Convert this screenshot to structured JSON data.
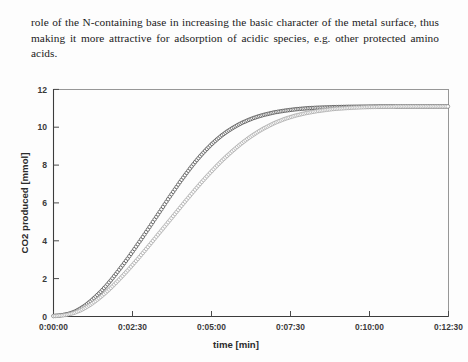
{
  "document": {
    "paragraph": "role of the N-containing base in increasing the basic character of the metal surface, thus making it more attractive for adsorption of acidic species, e.g. other protected amino acids."
  },
  "figure": {
    "name": "co2-production-vs-time-plot"
  },
  "chart_data": {
    "type": "scatter",
    "title": "",
    "xlabel": "time [min]",
    "ylabel": "CO2 produced [mmol]",
    "xtick_labels": [
      "0:00:00",
      "0:02:30",
      "0:05:00",
      "0:07:30",
      "0:10:00",
      "0:12:30"
    ],
    "xtick_values": [
      0,
      150,
      300,
      450,
      600,
      750
    ],
    "ytick_labels": [
      "0",
      "2",
      "4",
      "6",
      "8",
      "10",
      "12"
    ],
    "ytick_values": [
      0,
      2,
      4,
      6,
      8,
      10,
      12
    ],
    "xlim": [
      0,
      750
    ],
    "ylim": [
      0,
      12
    ],
    "grid": false,
    "legend": null,
    "marker": "open-circle",
    "series": [
      {
        "name": "faster-catalyst",
        "color": "#2f2f2f",
        "x": [
          0,
          10,
          20,
          30,
          40,
          50,
          60,
          70,
          80,
          90,
          100,
          110,
          120,
          130,
          140,
          150,
          160,
          170,
          180,
          190,
          200,
          210,
          220,
          230,
          240,
          250,
          260,
          270,
          280,
          290,
          300,
          310,
          320,
          330,
          340,
          350,
          360,
          370,
          380,
          390,
          400,
          420,
          440,
          460,
          480,
          500,
          530,
          560,
          590,
          620,
          650,
          680,
          710,
          750
        ],
        "values": [
          0.03,
          0.05,
          0.09,
          0.15,
          0.25,
          0.4,
          0.58,
          0.8,
          1.05,
          1.32,
          1.62,
          1.95,
          2.3,
          2.66,
          3.03,
          3.42,
          3.82,
          4.22,
          4.63,
          5.05,
          5.46,
          5.88,
          6.3,
          6.7,
          7.1,
          7.48,
          7.85,
          8.2,
          8.52,
          8.82,
          9.1,
          9.35,
          9.58,
          9.78,
          9.96,
          10.12,
          10.26,
          10.38,
          10.49,
          10.58,
          10.66,
          10.79,
          10.88,
          10.95,
          11.0,
          11.03,
          11.06,
          11.08,
          11.09,
          11.1,
          11.1,
          11.1,
          11.1,
          11.1
        ]
      },
      {
        "name": "slower-catalyst",
        "color": "#9a9a9a",
        "x": [
          0,
          10,
          20,
          30,
          40,
          50,
          60,
          70,
          80,
          90,
          100,
          110,
          120,
          130,
          140,
          150,
          160,
          170,
          180,
          190,
          200,
          210,
          220,
          230,
          240,
          250,
          260,
          270,
          280,
          290,
          300,
          310,
          320,
          330,
          340,
          350,
          360,
          370,
          380,
          390,
          400,
          420,
          440,
          460,
          480,
          500,
          530,
          560,
          590,
          620,
          650,
          680,
          710,
          750
        ],
        "values": [
          0.02,
          0.04,
          0.07,
          0.12,
          0.2,
          0.31,
          0.45,
          0.62,
          0.82,
          1.04,
          1.28,
          1.54,
          1.82,
          2.11,
          2.41,
          2.72,
          3.04,
          3.37,
          3.7,
          4.04,
          4.38,
          4.72,
          5.06,
          5.4,
          5.74,
          6.08,
          6.41,
          6.74,
          7.06,
          7.37,
          7.67,
          7.96,
          8.24,
          8.5,
          8.75,
          8.99,
          9.21,
          9.42,
          9.61,
          9.79,
          9.95,
          10.23,
          10.45,
          10.62,
          10.75,
          10.85,
          10.96,
          11.02,
          11.06,
          11.08,
          11.09,
          11.1,
          11.1,
          11.1
        ]
      }
    ]
  }
}
